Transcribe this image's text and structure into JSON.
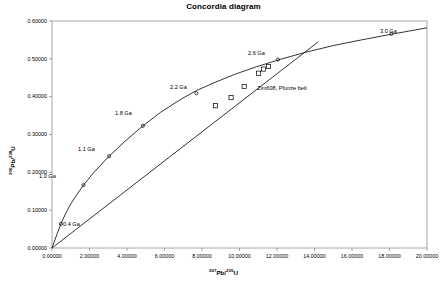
{
  "chart_data": {
    "type": "line",
    "title": "Concordia diagram",
    "xlabel_html": "207Pb/235U",
    "xlabel_nuclide": "Pb",
    "xlabel_sup_left": "207",
    "xlabel_sup_right": "235",
    "xlabel_denom": "U",
    "ylabel_sup_left": "206",
    "ylabel_nuclide": "Pb",
    "ylabel_sup_right": "238",
    "ylabel_denom": "U",
    "xlim": [
      0,
      20
    ],
    "ylim": [
      0,
      0.6
    ],
    "grid": false,
    "legend": "none",
    "xticks": [
      0,
      2,
      4,
      6,
      8,
      10,
      12,
      14,
      16,
      18,
      20
    ],
    "xtick_labels": [
      "0.00000",
      "2.00000",
      "4.00000",
      "6.00000",
      "8.00000",
      "10.00000",
      "12.00000",
      "14.00000",
      "16.00000",
      "18.00000",
      "20.00000"
    ],
    "yticks": [
      0,
      0.1,
      0.2,
      0.3,
      0.4,
      0.5,
      0.6
    ],
    "ytick_labels": [
      "0.00000",
      "0.10000",
      "0.20000",
      "0.30000",
      "0.40000",
      "0.50000",
      "0.60000"
    ],
    "series": [
      {
        "name": "concordia-curve",
        "type": "line",
        "points": [
          [
            0.0,
            0.0
          ],
          [
            0.2791,
            0.0382
          ],
          [
            0.4767,
            0.0638
          ],
          [
            0.7094,
            0.0894
          ],
          [
            1.0,
            0.1166
          ],
          [
            1.3,
            0.1394
          ],
          [
            1.6797,
            0.1661
          ],
          [
            2.2,
            0.198
          ],
          [
            2.8,
            0.23
          ],
          [
            3.047,
            0.2426
          ],
          [
            3.8,
            0.278
          ],
          [
            4.8,
            0.321
          ],
          [
            5.8,
            0.359
          ],
          [
            6.9,
            0.394
          ],
          [
            7.7,
            0.416
          ],
          [
            8.7,
            0.438
          ],
          [
            9.8,
            0.46
          ],
          [
            10.9,
            0.479
          ],
          [
            12.2,
            0.499
          ],
          [
            13.5,
            0.517
          ],
          [
            15.0,
            0.535
          ],
          [
            16.5,
            0.55
          ],
          [
            18.1,
            0.565
          ],
          [
            19.0,
            0.573
          ],
          [
            20.0,
            0.582
          ]
        ]
      },
      {
        "name": "discordia-line",
        "type": "line",
        "points": [
          [
            0.0,
            0.0
          ],
          [
            14.2,
            0.545
          ]
        ]
      }
    ],
    "concordia_age_markers": [
      {
        "label": "0.4 Ga",
        "x": 0.4767,
        "y": 0.0638,
        "lx": 63,
        "ly": 221
      },
      {
        "label": "1.0 Ga",
        "x": 1.6797,
        "y": 0.1661,
        "lx": 39,
        "ly": 173
      },
      {
        "label": "1.1 Ga",
        "x": 3.047,
        "y": 0.2426,
        "lx": 78,
        "ly": 146
      },
      {
        "label": "1.8 Ga",
        "x": 4.85,
        "y": 0.323,
        "lx": 115,
        "ly": 110
      },
      {
        "label": "2.2 Ga",
        "x": 7.7,
        "y": 0.409,
        "lx": 170,
        "ly": 84
      },
      {
        "label": "2.6 Ga",
        "x": 12.05,
        "y": 0.498,
        "lx": 248,
        "ly": 50
      },
      {
        "label": "3.0 Ga",
        "x": 18.1,
        "y": 0.566,
        "lx": 380,
        "ly": 28
      }
    ],
    "data_points": [
      {
        "x": 8.72,
        "y": 0.376
      },
      {
        "x": 9.55,
        "y": 0.3975
      },
      {
        "x": 10.25,
        "y": 0.427
      },
      {
        "x": 11.02,
        "y": 0.462
      },
      {
        "x": 11.28,
        "y": 0.473
      },
      {
        "x": 11.55,
        "y": 0.48
      }
    ],
    "annotations": [
      {
        "name": "sample-label",
        "text": "Zim608, Pfunze belt",
        "lx": 257,
        "ly": 85
      }
    ]
  }
}
